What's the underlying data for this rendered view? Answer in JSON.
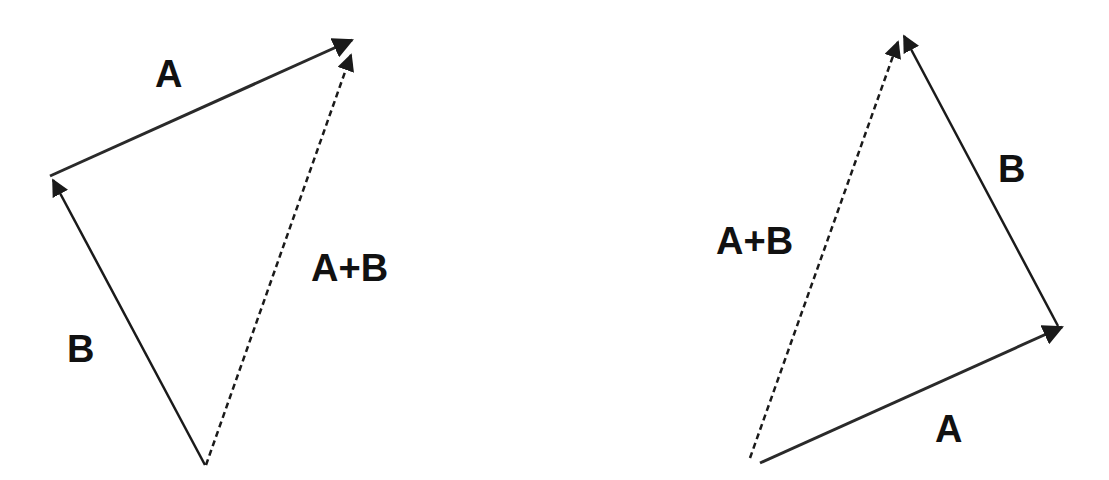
{
  "diagrams": [
    {
      "name": "tip-to-tail-B-then-A",
      "vectors": [
        {
          "label": "B",
          "style": "solid",
          "from": [
            205,
            465
          ],
          "to": [
            52,
            178
          ]
        },
        {
          "label": "A",
          "style": "solid",
          "from": [
            52,
            178
          ],
          "to": [
            352,
            40
          ]
        },
        {
          "label": "A+B",
          "style": "dashed",
          "from": [
            205,
            465
          ],
          "to": [
            352,
            55
          ]
        }
      ],
      "labels": {
        "a": "A",
        "b": "B",
        "sum": "A+B"
      }
    },
    {
      "name": "tip-to-tail-A-then-B",
      "vectors": [
        {
          "label": "A",
          "style": "solid",
          "from": [
            760,
            462
          ],
          "to": [
            1062,
            326
          ]
        },
        {
          "label": "B",
          "style": "solid",
          "from": [
            1062,
            326
          ],
          "to": [
            904,
            36
          ]
        },
        {
          "label": "A+B",
          "style": "dashed",
          "from": [
            750,
            458
          ],
          "to": [
            898,
            40
          ]
        }
      ],
      "labels": {
        "a": "A",
        "b": "B",
        "sum": "A+B"
      }
    }
  ],
  "colors": {
    "line": "#1a1a1a",
    "background": "#ffffff"
  }
}
